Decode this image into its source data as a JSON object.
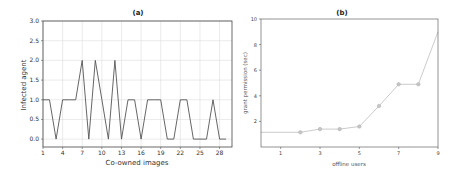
{
  "chart_data": [
    {
      "type": "line",
      "title": "(a)",
      "xlabel": "Co-owned images",
      "ylabel": "Infected agent",
      "x": [
        1,
        2,
        3,
        4,
        5,
        6,
        7,
        8,
        9,
        10,
        11,
        12,
        13,
        14,
        15,
        16,
        17,
        18,
        19,
        20,
        21,
        22,
        23,
        24,
        25,
        26,
        27,
        28,
        29
      ],
      "series": [
        {
          "name": "Infected agent",
          "values": [
            1,
            1,
            0,
            1,
            1,
            1,
            2,
            0,
            2,
            1,
            0,
            2,
            0,
            1,
            1,
            0,
            1,
            1,
            1,
            0,
            0,
            1,
            1,
            0,
            0,
            0,
            1,
            0,
            0
          ],
          "color": "#555555"
        }
      ],
      "xticks": [
        1,
        4,
        7,
        10,
        13,
        16,
        19,
        22,
        25,
        28
      ],
      "yticks": [
        "0.0",
        "0.5",
        "1.0",
        "1.5",
        "2.0",
        "2.5",
        "3.0"
      ],
      "xlim": [
        1,
        29.9
      ],
      "ylim": [
        -0.2,
        3.0
      ],
      "grid": true,
      "legend": null
    },
    {
      "type": "line",
      "title": "(b)",
      "xlabel": "offline users",
      "ylabel": "grant permission (sec)",
      "x": [
        0,
        2,
        3,
        4,
        5,
        6,
        7,
        8,
        9
      ],
      "series": [
        {
          "name": "grant permission",
          "values": [
            1.15,
            1.15,
            1.4,
            1.4,
            1.6,
            3.2,
            4.9,
            4.9,
            9.0
          ],
          "color": "#b5b5b5",
          "markers": [
            false,
            true,
            true,
            true,
            true,
            true,
            true,
            true,
            false
          ]
        }
      ],
      "xticks": [
        1,
        3,
        5,
        7,
        9
      ],
      "yticks": [
        "2",
        "4",
        "6",
        "8",
        "10"
      ],
      "xlim": [
        0,
        9
      ],
      "ylim": [
        0,
        10
      ],
      "grid": false,
      "legend": null
    }
  ]
}
